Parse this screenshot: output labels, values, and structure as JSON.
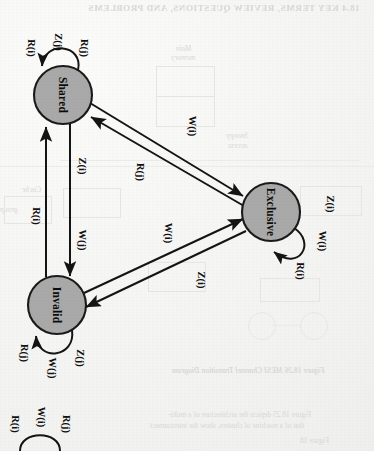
{
  "figure": {
    "kind": "state-transition-diagram",
    "orientation_degrees": 90,
    "scan_artifacts": true
  },
  "palette": {
    "paper": "#f7f7f6",
    "node_fill": "#a9a9a9",
    "node_stroke": "#1a1a1a",
    "edge": "#141414",
    "bleed_text": "#d9d9d7"
  },
  "states": [
    {
      "id": "shared",
      "label": "Shared",
      "cx": 63,
      "cy": 95,
      "r": 29
    },
    {
      "id": "exclusive",
      "label": "Exclusive",
      "cx": 271,
      "cy": 212,
      "r": 29
    },
    {
      "id": "invalid",
      "label": "Invalid",
      "cx": 57,
      "cy": 305,
      "r": 29
    }
  ],
  "self_loops": [
    {
      "id": "shared-loop",
      "state": "shared",
      "labels": [
        "R(i)",
        "Z(j)",
        "R(j)"
      ]
    },
    {
      "id": "exclusive-loop",
      "state": "exclusive",
      "labels": [
        "Z(i)",
        "W(i)",
        "R(i)"
      ]
    },
    {
      "id": "invalid-loop",
      "state": "invalid",
      "labels": [
        "R(j)",
        "W(j)",
        "Z(j)"
      ]
    },
    {
      "id": "partial-loop",
      "state": "off-page",
      "labels": [
        "R(i)",
        "W(i)",
        "R(j)"
      ]
    }
  ],
  "transitions": [
    {
      "id": "invalid-to-shared",
      "from": "Invalid",
      "to": "Shared",
      "label": "R(i)"
    },
    {
      "id": "shared-to-invalid",
      "from": "Shared",
      "to": "Invalid",
      "label": "Z(i)"
    },
    {
      "id": "shared-to-invalid-w",
      "from": "Shared",
      "to": "Invalid",
      "label": "W(j)"
    },
    {
      "id": "shared-to-exclusive",
      "from": "Shared",
      "to": "Exclusive",
      "label": "W(i)"
    },
    {
      "id": "exclusive-to-shared",
      "from": "Exclusive",
      "to": "Shared",
      "label": "R(j)"
    },
    {
      "id": "invalid-to-exclusive",
      "from": "Invalid",
      "to": "Exclusive",
      "label": "W(i)"
    },
    {
      "id": "exclusive-to-invalid",
      "from": "Exclusive",
      "to": "Invalid",
      "label": "Z(i)"
    }
  ],
  "bleed": {
    "header": "18.4  KEY TERMS, REVIEW QUESTIONS, AND PROBLEMS",
    "main_memory": "Main",
    "main_memory2": "memory",
    "snoopy": "Snoopy",
    "access": "access",
    "cache": "Cache",
    "group": "group",
    "caption": "Figure 18.26   MESI Channel Transition Diagram",
    "body1": "Figure 18.25 depicts the architecture of a multi-",
    "body2": "that of a machine of clusters, show the interconnect",
    "body3": "Figure 18"
  }
}
